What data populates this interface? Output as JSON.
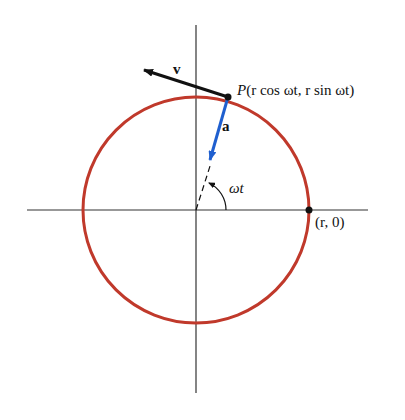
{
  "figure": {
    "type": "uniform circular motion diagram",
    "colors": {
      "circle": "#c0392b",
      "axes": "#333333",
      "velocity_vector": "#111111",
      "acceleration_vector": "#1f5fcf",
      "points": "#111111"
    },
    "labels": {
      "velocity": "v",
      "acceleration": "a",
      "point_P_prefix": "P",
      "point_P": "(r cos ωt, r sin ωt)",
      "angle": "ωt",
      "start_point": "(r, 0)"
    },
    "geometry": {
      "origin": [
        196,
        210
      ],
      "radius": 113,
      "point_P": [
        228,
        97
      ],
      "start_point": [
        309,
        210
      ],
      "x_axis": [
        27,
        368
      ],
      "y_axis": [
        25,
        393
      ]
    }
  }
}
